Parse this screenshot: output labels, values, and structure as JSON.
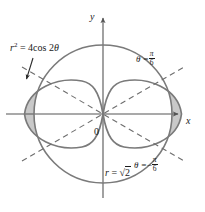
{
  "figure": {
    "width": 205,
    "height": 212,
    "background_color": "#ffffff",
    "curve_color": "#7a7a7a",
    "axis_color": "#555555",
    "shade_color": "#c9c9c9",
    "shade_stroke": "#7a7a7a",
    "dash_color": "#6e6e6e",
    "label_color": "#1a1a1a"
  },
  "axes": {
    "x_label": "x",
    "y_label": "y",
    "origin_label": "0",
    "origin_px": {
      "x": 103,
      "y": 114
    },
    "x_axis_from_px": {
      "x": 6,
      "y": 114
    },
    "x_axis_to_px": {
      "x": 182,
      "y": 114
    },
    "y_axis_from_px": {
      "x": 103,
      "y": 198
    },
    "y_axis_to_px": {
      "x": 103,
      "y": 14
    }
  },
  "curves": [
    {
      "name": "lemniscate",
      "label": "r² = 4cos 2θ",
      "label_parts": {
        "r": "r",
        "exponent": "2",
        "equals": " = ",
        "rhs": "4cos 2",
        "theta": "θ"
      },
      "equation": "r^2 = 4 cos 2theta",
      "a_value": 2,
      "max_radius_px": 79,
      "style": "solid"
    },
    {
      "name": "circle",
      "label": "r = √2",
      "label_parts": {
        "r": "r",
        "equals": " = ",
        "radical": "√",
        "radicand": "2"
      },
      "equation": "r = sqrt(2)",
      "radius_value": 1.41421356,
      "radius_px": 69,
      "style": "solid"
    },
    {
      "name": "ray-theta-plus-pi-over-6",
      "label_lhs": "θ =",
      "numerator": "π",
      "denominator": "6",
      "sign": "",
      "angle_degrees": 30,
      "style": "dashed"
    },
    {
      "name": "ray-theta-minus-pi-over-6",
      "label_lhs": "θ =",
      "numerator": "π",
      "denominator": "6",
      "sign": "−",
      "angle_degrees": -30,
      "style": "dashed"
    }
  ],
  "shaded_regions": [
    {
      "name": "left-shaded-region",
      "description": "region inside lemniscate left lobe and outside circle",
      "side": "left"
    },
    {
      "name": "right-shaded-region",
      "description": "region inside lemniscate right lobe and outside circle",
      "side": "right"
    }
  ],
  "annotations": {
    "leader_arrow": {
      "name": "leader-arrow-to-left-region",
      "from_px": {
        "x": 31,
        "y": 60
      },
      "to_px": {
        "x": 26,
        "y": 80
      }
    }
  },
  "intersections": [
    {
      "x_px": 56,
      "y_px": 83
    },
    {
      "x_px": 150,
      "y_px": 83
    },
    {
      "x_px": 56,
      "y_px": 145
    },
    {
      "x_px": 150,
      "y_px": 145
    }
  ]
}
